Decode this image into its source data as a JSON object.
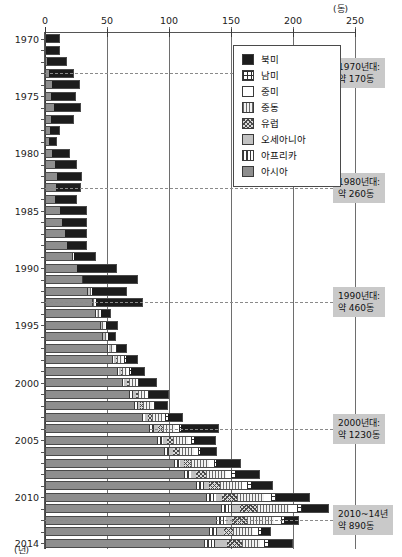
{
  "axes": {
    "x_unit": "(동)",
    "y_unit": "(년)",
    "x_ticks": [
      0,
      50,
      100,
      150,
      200,
      250
    ],
    "y_ticks": [
      1970,
      1975,
      1980,
      1985,
      1990,
      1995,
      2000,
      2005,
      2010,
      2014
    ]
  },
  "legend": {
    "items": [
      {
        "label": "북미",
        "pattern": "solid-black",
        "swatch": "p-bukmi"
      },
      {
        "label": "남미",
        "pattern": "grid-crosshatch",
        "swatch": "p-nammi"
      },
      {
        "label": "중미",
        "pattern": "white-empty",
        "swatch": "p-jungmi"
      },
      {
        "label": "중동",
        "pattern": "fine-vertical-dots",
        "swatch": "p-jungdong"
      },
      {
        "label": "유럽",
        "pattern": "diagonal-crosshatch",
        "swatch": "p-europe"
      },
      {
        "label": "오세아니아",
        "pattern": "solid-light-gray",
        "swatch": "p-oceania"
      },
      {
        "label": "아프리카",
        "pattern": "vertical-stripes",
        "swatch": "p-africa"
      },
      {
        "label": "아시아",
        "pattern": "solid-mid-gray",
        "swatch": "p-asia"
      }
    ]
  },
  "annotations": [
    {
      "line1": "1970년대:",
      "line2": "약 170동",
      "year": 1973
    },
    {
      "line1": "1980년대:",
      "line2": "약 260동",
      "year": 1983
    },
    {
      "line1": "1990년대:",
      "line2": "약 460동",
      "year": 1993
    },
    {
      "line1": "2000년대:",
      "line2": "약 1230동",
      "year": 2004
    },
    {
      "line1": "2010~14년",
      "line2": "약 890동",
      "year": 2012
    }
  ],
  "chart_data": {
    "type": "bar",
    "orientation": "horizontal",
    "stacked": true,
    "title": "",
    "xlabel": "(동)",
    "ylabel": "(년)",
    "xlim": [
      0,
      250
    ],
    "grid": true,
    "legend_position": "top-right-inside",
    "categories": [
      1970,
      1971,
      1972,
      1973,
      1974,
      1975,
      1976,
      1977,
      1978,
      1979,
      1980,
      1981,
      1982,
      1983,
      1984,
      1985,
      1986,
      1987,
      1988,
      1989,
      1990,
      1991,
      1992,
      1993,
      1994,
      1995,
      1996,
      1997,
      1998,
      1999,
      2000,
      2001,
      2002,
      2003,
      2004,
      2005,
      2006,
      2007,
      2008,
      2009,
      2010,
      2011,
      2012,
      2013,
      2014
    ],
    "series": [
      {
        "name": "아시아",
        "values": [
          0,
          0,
          2,
          3,
          6,
          5,
          7,
          5,
          4,
          3,
          6,
          8,
          10,
          9,
          8,
          12,
          14,
          16,
          18,
          22,
          26,
          30,
          34,
          38,
          40,
          44,
          46,
          50,
          54,
          58,
          62,
          68,
          72,
          78,
          84,
          90,
          96,
          104,
          112,
          122,
          130,
          142,
          138,
          132,
          128
        ]
      },
      {
        "name": "아프리카",
        "values": [
          0,
          0,
          0,
          0,
          0,
          0,
          0,
          0,
          0,
          0,
          0,
          0,
          0,
          0,
          0,
          0,
          0,
          0,
          0,
          1,
          0,
          1,
          1,
          1,
          2,
          1,
          1,
          2,
          2,
          2,
          2,
          3,
          3,
          3,
          4,
          5,
          4,
          5,
          6,
          6,
          8,
          9,
          8,
          7,
          9
        ]
      },
      {
        "name": "오세아니아",
        "values": [
          0,
          0,
          0,
          0,
          0,
          0,
          0,
          0,
          0,
          0,
          0,
          0,
          0,
          0,
          0,
          0,
          0,
          0,
          0,
          0,
          0,
          0,
          1,
          0,
          1,
          1,
          1,
          1,
          1,
          1,
          2,
          2,
          2,
          2,
          3,
          3,
          3,
          3,
          4,
          4,
          5,
          6,
          5,
          5,
          10
        ]
      },
      {
        "name": "유럽",
        "values": [
          0,
          0,
          0,
          0,
          0,
          0,
          0,
          0,
          0,
          0,
          0,
          0,
          0,
          0,
          0,
          0,
          0,
          0,
          0,
          0,
          0,
          0,
          0,
          0,
          0,
          0,
          0,
          0,
          1,
          1,
          2,
          2,
          2,
          3,
          4,
          5,
          5,
          6,
          8,
          9,
          12,
          14,
          12,
          8,
          12
        ]
      },
      {
        "name": "중동",
        "values": [
          0,
          0,
          0,
          0,
          0,
          0,
          0,
          0,
          0,
          0,
          0,
          0,
          0,
          0,
          0,
          0,
          0,
          0,
          0,
          0,
          0,
          0,
          1,
          1,
          1,
          2,
          2,
          3,
          4,
          4,
          5,
          6,
          7,
          8,
          10,
          12,
          12,
          14,
          16,
          18,
          22,
          26,
          22,
          16,
          14
        ]
      },
      {
        "name": "중미",
        "values": [
          0,
          0,
          0,
          0,
          0,
          0,
          0,
          0,
          0,
          0,
          0,
          0,
          0,
          0,
          0,
          0,
          0,
          0,
          0,
          0,
          0,
          0,
          1,
          1,
          1,
          1,
          1,
          1,
          2,
          2,
          2,
          2,
          2,
          3,
          3,
          3,
          3,
          4,
          4,
          4,
          5,
          6,
          5,
          4,
          4
        ]
      },
      {
        "name": "남미",
        "values": [
          0,
          0,
          0,
          0,
          0,
          0,
          0,
          0,
          0,
          0,
          0,
          0,
          0,
          0,
          0,
          0,
          0,
          0,
          0,
          0,
          0,
          0,
          0,
          0,
          0,
          0,
          0,
          1,
          1,
          1,
          1,
          1,
          1,
          2,
          2,
          2,
          2,
          2,
          3,
          3,
          4,
          4,
          3,
          2,
          3
        ]
      },
      {
        "name": "북미",
        "values": [
          12,
          12,
          16,
          20,
          22,
          20,
          22,
          18,
          8,
          7,
          14,
          18,
          20,
          20,
          18,
          22,
          20,
          18,
          16,
          18,
          32,
          44,
          28,
          38,
          8,
          10,
          6,
          8,
          10,
          12,
          14,
          16,
          10,
          12,
          30,
          18,
          14,
          20,
          20,
          18,
          28,
          22,
          12,
          8,
          20
        ]
      }
    ]
  }
}
